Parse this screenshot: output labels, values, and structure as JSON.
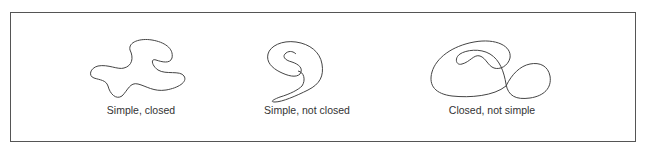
{
  "figure": {
    "panels": [
      {
        "id": "simple-closed",
        "caption": "Simple, closed",
        "curve_type": "simple closed curve"
      },
      {
        "id": "simple-not-closed",
        "caption": "Simple, not closed",
        "curve_type": "simple open curve"
      },
      {
        "id": "closed-not-simple",
        "caption": "Closed, not simple",
        "curve_type": "closed self-intersecting curve"
      }
    ],
    "colors": {
      "stroke": "#444444",
      "frame": "#555555",
      "text": "#333333",
      "background": "#ffffff"
    }
  }
}
